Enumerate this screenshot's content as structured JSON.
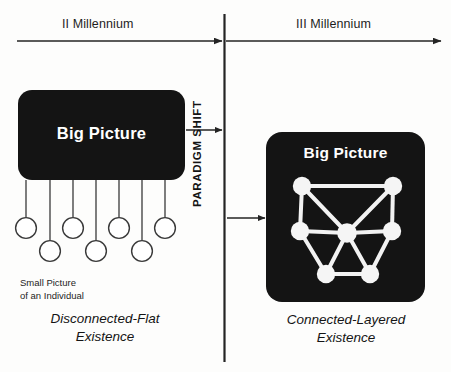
{
  "diagram": {
    "title_left_box": "Big Picture",
    "title_right_box": "Big Picture",
    "timeline": {
      "left_era": "II Millennium",
      "right_era": "III Millennium"
    },
    "divider_label": "PARADIGM SHIFT",
    "left_side": {
      "node_caption_line1": "Small Picture",
      "node_caption_line2": "of an Individual",
      "caption_line1": "Disconnected-Flat",
      "caption_line2": "Existence",
      "small_nodes": [
        {
          "id": "n1",
          "cx": 26,
          "cy": 228,
          "r": 10.5,
          "row": "upper"
        },
        {
          "id": "n2",
          "cx": 50,
          "cy": 251,
          "r": 10.5,
          "row": "lower"
        },
        {
          "id": "n3",
          "cx": 73,
          "cy": 228,
          "r": 10.5,
          "row": "upper"
        },
        {
          "id": "n4",
          "cx": 96,
          "cy": 251,
          "r": 10.5,
          "row": "lower"
        },
        {
          "id": "n5",
          "cx": 119,
          "cy": 228,
          "r": 10.5,
          "row": "upper"
        },
        {
          "id": "n6",
          "cx": 142,
          "cy": 251,
          "r": 10.5,
          "row": "lower"
        },
        {
          "id": "n7",
          "cx": 165,
          "cy": 228,
          "r": 10.5,
          "row": "upper"
        }
      ],
      "stems": [
        {
          "x": 26,
          "y1": 180,
          "y2": 217
        },
        {
          "x": 50,
          "y1": 180,
          "y2": 240
        },
        {
          "x": 73,
          "y1": 180,
          "y2": 217
        },
        {
          "x": 96,
          "y1": 180,
          "y2": 240
        },
        {
          "x": 119,
          "y1": 180,
          "y2": 217
        },
        {
          "x": 142,
          "y1": 180,
          "y2": 240
        },
        {
          "x": 165,
          "y1": 180,
          "y2": 217
        }
      ]
    },
    "right_side": {
      "caption_line1": "Connected-Layered",
      "caption_line2": "Existence",
      "network_nodes": [
        {
          "id": "tl",
          "cx": 302,
          "cy": 186,
          "r": 9
        },
        {
          "id": "tr",
          "cx": 393,
          "cy": 186,
          "r": 9
        },
        {
          "id": "ml",
          "cx": 300,
          "cy": 231,
          "r": 9
        },
        {
          "id": "c",
          "cx": 347,
          "cy": 233,
          "r": 9.5
        },
        {
          "id": "mr",
          "cx": 392,
          "cy": 231,
          "r": 9
        },
        {
          "id": "bl",
          "cx": 326,
          "cy": 274,
          "r": 9
        },
        {
          "id": "br",
          "cx": 370,
          "cy": 274,
          "r": 9
        }
      ],
      "network_edges": [
        [
          "tl",
          "tr"
        ],
        [
          "tl",
          "ml"
        ],
        [
          "tl",
          "c"
        ],
        [
          "tr",
          "mr"
        ],
        [
          "tr",
          "c"
        ],
        [
          "ml",
          "c"
        ],
        [
          "ml",
          "bl"
        ],
        [
          "c",
          "mr"
        ],
        [
          "c",
          "bl"
        ],
        [
          "c",
          "br"
        ],
        [
          "mr",
          "br"
        ],
        [
          "bl",
          "br"
        ]
      ]
    },
    "colors": {
      "box_fill": "#141414",
      "box_text": "#ffffff",
      "node_fill": "#ffffff",
      "node_stroke": "#3a3a3a",
      "line": "#242424",
      "network_node_fill": "#f2f2f2",
      "background": "#fdfdfc"
    }
  }
}
